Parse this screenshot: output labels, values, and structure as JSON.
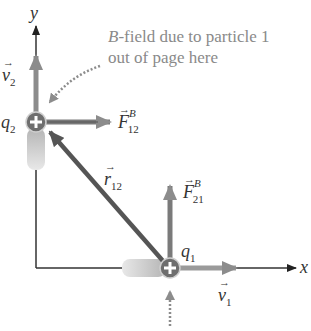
{
  "diagram": {
    "axes": {
      "x_label": "x",
      "y_label": "y"
    },
    "annotation": {
      "line1_italic": "B",
      "line1_rest": "-field due to particle 1",
      "line2": "out of page here"
    },
    "particles": [
      {
        "name": "q",
        "sub": "2",
        "charge_symbol": "+"
      },
      {
        "name": "q",
        "sub": "1",
        "charge_symbol": "+"
      }
    ],
    "vectors": {
      "v2": {
        "name": "v",
        "sub": "2"
      },
      "v1": {
        "name": "v",
        "sub": "1"
      },
      "F12": {
        "name": "F",
        "sub": "12",
        "sup": "B"
      },
      "F21": {
        "name": "F",
        "sub": "21",
        "sup": "B"
      },
      "r12": {
        "name": "r",
        "sub": "12"
      }
    },
    "colors": {
      "arrow": "#8c8c8c",
      "arrow_dark": "#5a5a5a",
      "axis": "#333333",
      "particle": "#6e6e6e",
      "annotation_text": "#8a8a8a"
    }
  }
}
